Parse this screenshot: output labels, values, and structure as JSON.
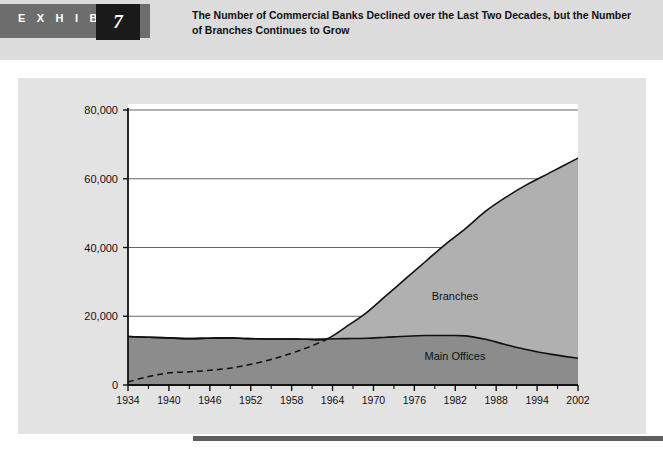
{
  "exhibit": {
    "label": "E X H I B I T",
    "number": "7",
    "title_line1": "The Number of Commercial Banks Declined over the Last Two Decades, but the",
    "title_line2": "Number of Branches Continues to Grow"
  },
  "colors": {
    "header_band": "#dcdcdc",
    "exhibit_tab": "#6d6d6d",
    "exhibit_number_box": "#1a1a1a",
    "card_background": "#e3e3e3",
    "plot_background": "#ffffff",
    "branches_fill": "#b0b0b0",
    "main_offices_fill": "#8c8c8c",
    "line_stroke": "#111111",
    "grid_stroke": "#555555",
    "footer_rule": "#5e5e5e"
  },
  "chart_data": {
    "type": "area",
    "title": "The Number of Commercial Banks Declined over the Last Two Decades, but the Number of Branches Continues to Grow",
    "xlabel": "",
    "ylabel": "",
    "stacked": true,
    "grid": true,
    "legend": "inline-annotations",
    "xlim": [
      1934,
      2002
    ],
    "ylim": [
      0,
      80000
    ],
    "ytick_labels": [
      "0",
      "20,000",
      "40,000",
      "60,000",
      "80,000"
    ],
    "ytick_values": [
      0,
      20000,
      40000,
      60000,
      80000
    ],
    "xtick_labels": [
      "1934",
      "1940",
      "1946",
      "1952",
      "1958",
      "1964",
      "1970",
      "1976",
      "1982",
      "1988",
      "1994",
      "2002"
    ],
    "xtick_values": [
      1934,
      1940,
      1946,
      1952,
      1958,
      1964,
      1970,
      1976,
      1982,
      1988,
      1994,
      2002
    ],
    "x": [
      1934,
      1937,
      1940,
      1943,
      1946,
      1949,
      1952,
      1955,
      1958,
      1961,
      1964,
      1967,
      1970,
      1973,
      1976,
      1979,
      1982,
      1985,
      1988,
      1991,
      1994,
      1998,
      2002
    ],
    "series": [
      {
        "name": "Main Offices",
        "annotation": "Main Offices",
        "values": [
          14100,
          13900,
          13700,
          13500,
          13600,
          13700,
          13500,
          13400,
          13400,
          13300,
          13400,
          13500,
          13600,
          13900,
          14200,
          14400,
          14400,
          14300,
          13300,
          11800,
          10400,
          8900,
          7800
        ]
      },
      {
        "name": "Branches",
        "annotation": "Branches",
        "dashed_until": 1964,
        "values": [
          900,
          2400,
          3500,
          3800,
          4200,
          4800,
          5800,
          7100,
          8800,
          10800,
          13200,
          17000,
          21000,
          26000,
          31000,
          36000,
          41000,
          45500,
          50500,
          54500,
          58000,
          62000,
          66000
        ]
      }
    ]
  }
}
